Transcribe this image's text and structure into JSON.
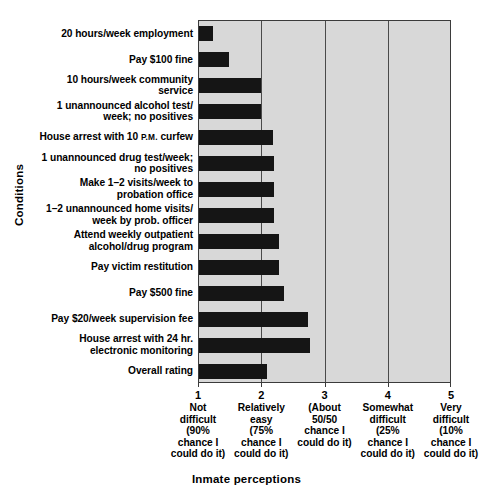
{
  "chart_data": {
    "type": "bar",
    "orientation": "horizontal",
    "title": "",
    "xlabel": "Inmate perceptions",
    "ylabel": "Conditions",
    "xlim": [
      1,
      5
    ],
    "grid": true,
    "legend": "none",
    "categories": [
      "20 hours/week employment",
      "Pay $100 fine",
      "10 hours/week community\nservice",
      "1 unannounced alcohol test/\nweek; no positives",
      "House arrest with 10 P.M. curfew",
      "1 unannounced drug test/week;\nno positives",
      "Make 1–2 visits/week to\nprobation office",
      "1–2 unannounced home visits/\nweek by prob. officer",
      "Attend weekly outpatient\nalcohol/drug program",
      "Pay victim restitution",
      "Pay $500 fine",
      "Pay $20/week supervision fee",
      "House arrest with 24 hr.\nelectronic monitoring",
      "Overall rating"
    ],
    "values": [
      1.22,
      1.47,
      1.98,
      1.98,
      2.17,
      2.19,
      2.19,
      2.19,
      2.27,
      2.27,
      2.35,
      2.73,
      2.75,
      2.07
    ],
    "xticks": [
      {
        "num": "1",
        "desc": "Not\ndifficult\n(90%\nchance I\ncould do it)"
      },
      {
        "num": "2",
        "desc": "Relatively\neasy\n(75%\nchance I\ncould do it)"
      },
      {
        "num": "3",
        "desc": "(About\n50/50\nchance I\ncould do it)"
      },
      {
        "num": "4",
        "desc": "Somewhat\ndifficult\n(25%\nchance I\ncould do it)"
      },
      {
        "num": "5",
        "desc": "Very\ndifficult\n(10%\nchance I\ncould do it)"
      }
    ],
    "colors": {
      "bar": "#151515",
      "plot_background": "#d8d8d8",
      "gridline": "#4a4a4a",
      "axis": "#3b3b3b",
      "text": "#000000"
    }
  }
}
